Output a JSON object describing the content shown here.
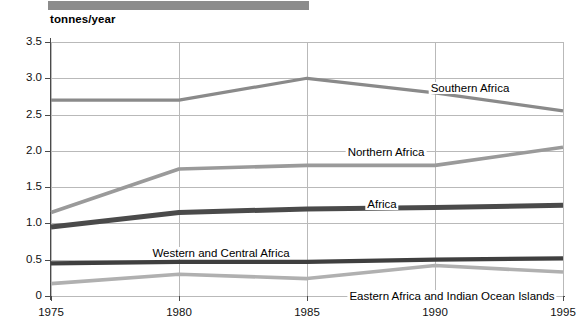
{
  "chart_data": {
    "type": "line",
    "title": "",
    "xlabel": "",
    "ylabel": "tonnes/year",
    "x": [
      1975,
      1980,
      1985,
      1990,
      1995
    ],
    "tick_labels_x": [
      "1975",
      "1980",
      "1985",
      "1990",
      "1995"
    ],
    "tick_labels_y": [
      "0",
      "0.5",
      "1.0",
      "1.5",
      "2.0",
      "2.5",
      "3.0",
      "3.5"
    ],
    "tick_values_y": [
      0,
      0.5,
      1.0,
      1.5,
      2.0,
      2.5,
      3.0,
      3.5
    ],
    "ylim": [
      0,
      3.5
    ],
    "xlim": [
      1975,
      1995
    ],
    "grid": true,
    "legend_position": "inline-labels",
    "series": [
      {
        "name": "Southern Africa",
        "values": [
          2.7,
          2.7,
          3.0,
          2.8,
          2.55
        ],
        "color": "#8a8a8a",
        "width": 3.2,
        "label_x": 470,
        "label_y": 82
      },
      {
        "name": "Northern Africa",
        "values": [
          1.15,
          1.75,
          1.8,
          1.8,
          2.05
        ],
        "color": "#9a9a9a",
        "width": 3.6,
        "label_x": 386,
        "label_y": 146
      },
      {
        "name": "Africa",
        "values": [
          0.95,
          1.15,
          1.2,
          1.22,
          1.25
        ],
        "color": "#4a4a4a",
        "width": 5.0,
        "label_x": 382,
        "label_y": 198
      },
      {
        "name": "Western and Central Africa",
        "values": [
          0.45,
          0.47,
          0.47,
          0.5,
          0.52
        ],
        "color": "#3f3f3f",
        "width": 4.2,
        "label_x": 221,
        "label_y": 247
      },
      {
        "name": "Eastern Africa and Indian Ocean Islands",
        "values": [
          0.17,
          0.3,
          0.24,
          0.42,
          0.33
        ],
        "color": "#b0b0b0",
        "width": 3.6,
        "label_x": 452,
        "label_y": 290
      }
    ]
  },
  "axis": {
    "unit_label": "tonnes/year"
  }
}
